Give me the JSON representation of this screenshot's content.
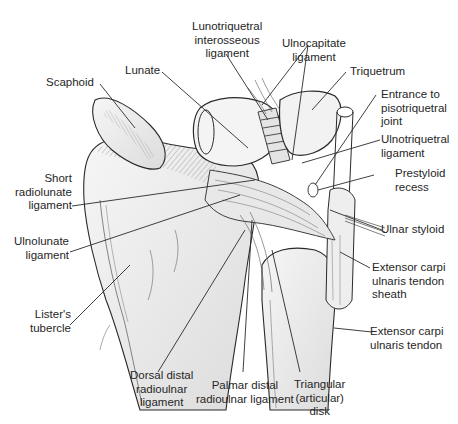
{
  "figure": {
    "type": "anatomical-illustration"
  },
  "labels": {
    "lunotriquetral": "Lunotriquetral\ninterosseous\nligament",
    "ulnocapitate": "Ulnocapitate\nligament",
    "triquetrum": "Triquetrum",
    "entrance_pisotriquetral": "Entrance to\npisotriquetral\njoint",
    "ulnotriquetral": "Ulnotriquetral\nligament",
    "prestyloid": "Prestyloid\nrecess",
    "ulnar_styloid": "Ulnar styloid",
    "ecu_sheath": "Extensor carpi\nulnaris tendon\nsheath",
    "ecu_tendon": "Extensor carpi\nulnaris tendon",
    "scaphoid": "Scaphoid",
    "lunate": "Lunate",
    "short_radiolunate": "Short\nradiolunate\nligament",
    "ulnolunate": "Ulnolunate\nligament",
    "listers": "Lister's\ntubercle",
    "dorsal_druj": "Dorsal distal\nradioulnar\nligament",
    "palmar_druj": "Palmar distal\nradioulnar ligament",
    "tfc_disk": "Triangular\n(articular)\ndisk"
  },
  "colors": {
    "ink": "#2a2a2a",
    "bone_fill": "#f1f1f1",
    "shade": "#d9d9d9",
    "background": "#ffffff"
  }
}
